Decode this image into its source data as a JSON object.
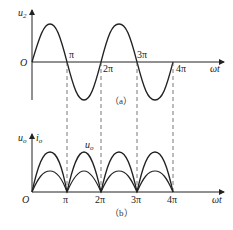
{
  "figure_a": {
    "y_label": "u",
    "y_label_sub": "2",
    "origin_label": "O",
    "x_label": "ωt",
    "ticks": [
      "π",
      "2π",
      "3π",
      "4π"
    ],
    "caption": "（a）",
    "curve": "sinusoid u2 over 0..4π"
  },
  "figure_b": {
    "y_label_left": "u",
    "y_label_left_sub": "o",
    "y_label_right": "i",
    "y_label_right_sub": "o",
    "curve_label": "u",
    "curve_label_sub": "o",
    "origin_label": "O",
    "x_label": "ωt",
    "ticks": [
      "π",
      "2π",
      "3π",
      "4π"
    ],
    "caption": "（b）",
    "curves": [
      "uo full-wave rectified (larger)",
      "io full-wave rectified (smaller)"
    ]
  },
  "colors": {
    "line": "#222222",
    "dash": "#555555"
  }
}
